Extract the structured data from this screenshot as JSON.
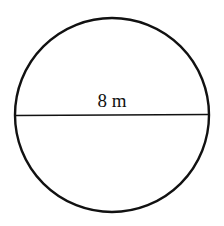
{
  "figure": {
    "shape": "circle",
    "center": [
      112,
      115
    ],
    "radius": 97,
    "stroke_color": "#111111",
    "diameter_label": "8 m",
    "diameter_value": 8,
    "diameter_unit": "m"
  }
}
